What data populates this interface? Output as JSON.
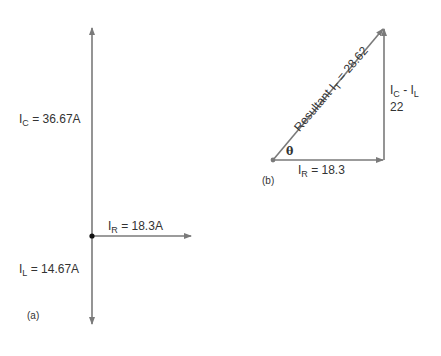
{
  "diagram_a": {
    "label": "(a)",
    "ic": {
      "sym": "I",
      "sub": "C",
      "value": " = 36.67A"
    },
    "il": {
      "sym": "I",
      "sub": "L",
      "value": " = 14.67A"
    },
    "ir": {
      "sym": "I",
      "sub": "R",
      "value": " = 18.3A"
    }
  },
  "diagram_b": {
    "label": "(b)",
    "resultant": {
      "prefix": "Resultant I",
      "sub": "T",
      "value": " = 28.62"
    },
    "ir": {
      "sym": "I",
      "sub": "R",
      "value": " = 18.3"
    },
    "vertical": {
      "sym1": "I",
      "sub1": "C",
      "mid": " - I",
      "sub2": "L",
      "value": "22"
    },
    "angle": "θ"
  },
  "colors": {
    "line": "#7a7a7a",
    "dot": "#111111",
    "text": "#333333"
  }
}
